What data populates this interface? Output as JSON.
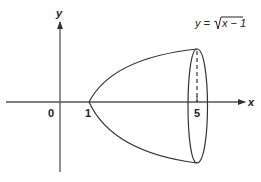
{
  "diagram": {
    "type": "solid-of-revolution",
    "equation": {
      "lhs": "y =",
      "radicand": "x − 1"
    },
    "axes": {
      "x_label": "x",
      "y_label": "y",
      "origin_label": "0"
    },
    "ticks": {
      "x1": "1",
      "x5": "5"
    },
    "colors": {
      "stroke": "#333333",
      "background": "#ffffff"
    }
  }
}
